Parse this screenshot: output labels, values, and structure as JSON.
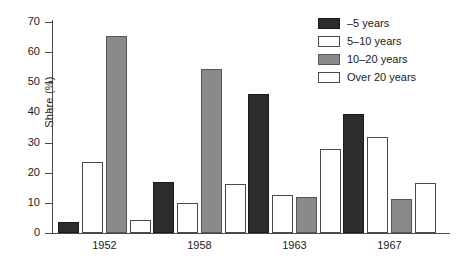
{
  "chart_data": {
    "type": "bar",
    "title": "",
    "xlabel": "",
    "ylabel": "Share (%)",
    "ylim": [
      0,
      70
    ],
    "yticks": [
      0,
      10,
      20,
      30,
      40,
      50,
      60,
      70
    ],
    "ytick_labels": [
      "0",
      "10",
      "20",
      "30",
      "40",
      "50",
      "60",
      "70"
    ],
    "grid": false,
    "legend_position": "top-right",
    "categories": [
      "1952",
      "1958",
      "1963",
      "1967"
    ],
    "series": [
      {
        "name": "–5 years",
        "color": "#2d2d2d",
        "swatch": "dark",
        "values": [
          3.7,
          17.0,
          46.0,
          39.5
        ]
      },
      {
        "name": "5–10 years",
        "color": "#ffffff",
        "swatch": "white",
        "values": [
          23.5,
          10.0,
          12.5,
          32.0
        ]
      },
      {
        "name": "10–20 years",
        "color": "#8a8a8a",
        "swatch": "gray",
        "values": [
          65.5,
          54.5,
          12.0,
          11.2
        ]
      },
      {
        "name": "Over 20 years",
        "color": "#ffffff",
        "swatch": "white",
        "values": [
          4.3,
          16.2,
          28.0,
          16.7
        ]
      }
    ]
  }
}
